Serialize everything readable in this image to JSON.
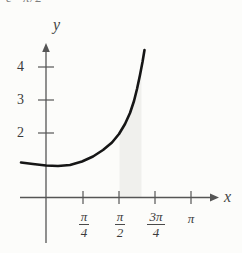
{
  "page": {
    "background": "#fcfcfa"
  },
  "top_fragment": {
    "text": "e π/2"
  },
  "axes": {
    "x_label": "x",
    "y_label": "y",
    "y_ticks": [
      {
        "label": "4"
      },
      {
        "label": "3"
      },
      {
        "label": "2"
      }
    ],
    "x_ticks": [
      {
        "num": "π",
        "den": "4"
      },
      {
        "num": "π",
        "den": "2"
      },
      {
        "num": "3π",
        "den": "4"
      },
      {
        "label": "π"
      }
    ]
  },
  "chart_data": {
    "type": "line",
    "title": "",
    "xlabel": "x",
    "ylabel": "y",
    "x_tick_labels": [
      "π/4",
      "π/2",
      "3π/4",
      "π"
    ],
    "y_tick_labels": [
      "2",
      "3",
      "4"
    ],
    "xlim_approx": [
      "-0.2π",
      "1.2π"
    ],
    "ylim_approx": [
      0,
      4.6
    ],
    "grid": false,
    "legend": "none",
    "series": [
      {
        "name": "curve",
        "points_math": [
          {
            "x": "-0.18π",
            "y": 1.08
          },
          {
            "x": "0",
            "y": 1.0
          },
          {
            "x": "π/4",
            "y": 1.15
          },
          {
            "x": "π/2",
            "y": 2.0
          },
          {
            "x": "0.6π",
            "y": 3.0
          },
          {
            "x": "0.65π",
            "y": 4.5
          }
        ]
      }
    ],
    "shaded_region": {
      "from_x": "π/2",
      "to_x": "≈0.65π",
      "bounded_by": "x-axis below, curve above"
    },
    "colors": {
      "axis": "#555555",
      "tick": "#555555",
      "curve": "#161616",
      "shade": "#f0f0ed",
      "label_text": "#3a3a3a",
      "background": "#fcfcfa"
    },
    "pixel": {
      "x_axis": {
        "x1": 20,
        "y": 197.5,
        "x2": 210
      },
      "y_axis": {
        "x": 46,
        "y1": 52,
        "y2": 243
      },
      "x_tick_px": [
        83,
        119,
        155,
        191
      ],
      "x_tick_span": [
        191,
        204
      ],
      "y_tick_px": [
        67,
        100,
        133
      ],
      "y_tick_span": [
        38,
        54
      ],
      "curve": [
        [
          21,
          162.5
        ],
        [
          33,
          164
        ],
        [
          46,
          165.5
        ],
        [
          58,
          166
        ],
        [
          70,
          165
        ],
        [
          82,
          161.5
        ],
        [
          93,
          156.5
        ],
        [
          103,
          150
        ],
        [
          112,
          142.5
        ],
        [
          119,
          134
        ],
        [
          125,
          124
        ],
        [
          130,
          113
        ],
        [
          134,
          101
        ],
        [
          137,
          89
        ],
        [
          140,
          75
        ],
        [
          142.5,
          62
        ],
        [
          144.5,
          50
        ]
      ],
      "shade": [
        [
          119.5,
          197
        ],
        [
          119.5,
          133
        ],
        [
          125,
          124
        ],
        [
          130,
          113
        ],
        [
          134,
          101
        ],
        [
          137,
          89
        ],
        [
          140,
          75
        ],
        [
          141.5,
          66
        ],
        [
          141.5,
          197
        ]
      ]
    }
  }
}
